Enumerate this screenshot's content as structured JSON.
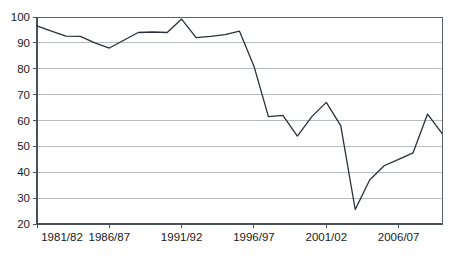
{
  "chart_data": {
    "type": "line",
    "title": "",
    "subtitle": "",
    "xlabel": "",
    "ylabel": "",
    "grid": "horizontal",
    "legend": "none",
    "xlim_categories": [
      "1981/82",
      "2009/10"
    ],
    "ylim": [
      20,
      100
    ],
    "yticks": [
      20,
      30,
      40,
      50,
      60,
      70,
      80,
      90,
      100
    ],
    "ytick_labels": [
      "20",
      "30",
      "40",
      "50",
      "60",
      "70",
      "80",
      "90",
      "100"
    ],
    "xticks": [
      "1981/82",
      "1986/87",
      "1991/92",
      "1996/97",
      "2001/02",
      "2006/07"
    ],
    "xtick_labels": [
      "1981/82",
      "1986/87",
      "1991/92",
      "1996/97",
      "2001/02",
      "2006/07"
    ],
    "categories": [
      "1981/82",
      "1982/83",
      "1983/84",
      "1984/85",
      "1985/86",
      "1986/87",
      "1987/88",
      "1988/89",
      "1989/90",
      "1990/91",
      "1991/92",
      "1992/93",
      "1993/94",
      "1994/95",
      "1995/96",
      "1996/97",
      "1997/98",
      "1998/99",
      "1999/00",
      "2000/01",
      "2001/02",
      "2002/03",
      "2003/04",
      "2004/05",
      "2005/06",
      "2006/07",
      "2007/08",
      "2008/09",
      "2009/10"
    ],
    "values": [
      96.6,
      94.5,
      92.6,
      92.5,
      90.0,
      88.0,
      91.0,
      94.0,
      94.2,
      94.0,
      99.2,
      92.0,
      92.5,
      93.2,
      94.5,
      81.0,
      61.5,
      62.0,
      54.0,
      61.5,
      67.0,
      58.0,
      25.6,
      37.0,
      42.5,
      45.0,
      47.5,
      62.5,
      55.0
    ],
    "series_color": "#2b2f3a",
    "grid_color": "#9aa0a6",
    "frame_color": "#5a6270"
  }
}
